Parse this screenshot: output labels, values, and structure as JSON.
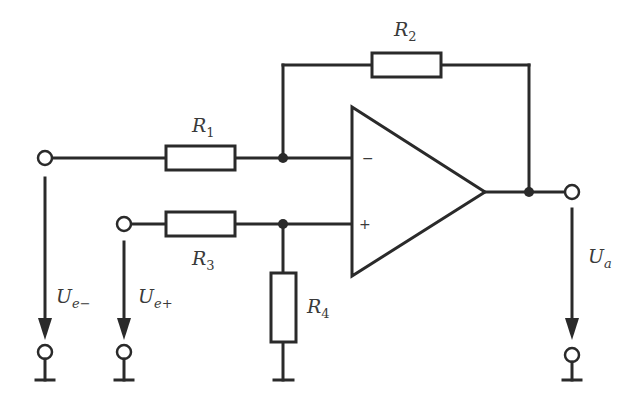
{
  "diagram": {
    "type": "op-amp subtractor (differential amplifier) circuit",
    "components": {
      "R1": {
        "label": "R",
        "sub": "1"
      },
      "R2": {
        "label": "R",
        "sub": "2"
      },
      "R3": {
        "label": "R",
        "sub": "3"
      },
      "R4": {
        "label": "R",
        "sub": "4"
      },
      "opamp": {
        "inverting_sign": "−",
        "noninverting_sign": "+"
      }
    },
    "voltages": {
      "ue_minus": {
        "label": "U",
        "sub": "e−"
      },
      "ue_plus": {
        "label": "U",
        "sub": "e+"
      },
      "ua": {
        "label": "U",
        "sub": "a"
      }
    },
    "colors": {
      "stroke": "#2a2a2a",
      "background": "#ffffff"
    }
  }
}
